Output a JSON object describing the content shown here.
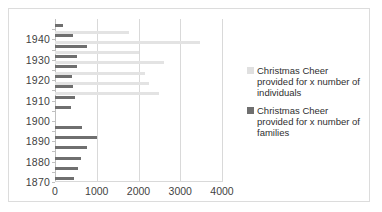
{
  "chart_data": {
    "type": "bar",
    "orientation": "horizontal",
    "title": "",
    "xlabel": "",
    "ylabel": "",
    "xlim": [
      0,
      4000
    ],
    "xticks": [
      "0",
      "1000",
      "2000",
      "3000",
      "4000"
    ],
    "xtick_values": [
      0,
      1000,
      2000,
      3000,
      4000
    ],
    "grid": true,
    "legend_position": "right",
    "ytick_labels": [
      "1940",
      "1930",
      "1920",
      "1910",
      "1900",
      "1890",
      "1880",
      "1870"
    ],
    "categories": [
      1945,
      1940,
      1935,
      1930,
      1925,
      1920,
      1915,
      1910,
      1905,
      1900,
      1895,
      1890,
      1885,
      1880,
      1875,
      1870
    ],
    "series": [
      {
        "name": "Christmas Cheer provided for x number of individuals",
        "color": "#e3e3e3",
        "values": [
          0,
          1780,
          3480,
          2020,
          2600,
          2160,
          2250,
          2500,
          0,
          0,
          0,
          0,
          0,
          0,
          0,
          0
        ]
      },
      {
        "name": "Christmas Cheer provided for x number of families",
        "color": "#6f6f6f",
        "values": [
          180,
          420,
          760,
          530,
          520,
          400,
          420,
          470,
          380,
          0,
          640,
          1010,
          770,
          630,
          560,
          460
        ]
      }
    ]
  },
  "legend": {
    "entries": [
      {
        "label": "Christmas Cheer provided for x number of individuals",
        "swatch": "individuals"
      },
      {
        "label": "Christmas Cheer provided for x number of families",
        "swatch": "families"
      }
    ]
  },
  "colors": {
    "individuals": "#e3e3e3",
    "families": "#6f6f6f",
    "gridline": "#d9d9d9",
    "border": "#dcdcdc",
    "text": "#3f3f3f"
  }
}
